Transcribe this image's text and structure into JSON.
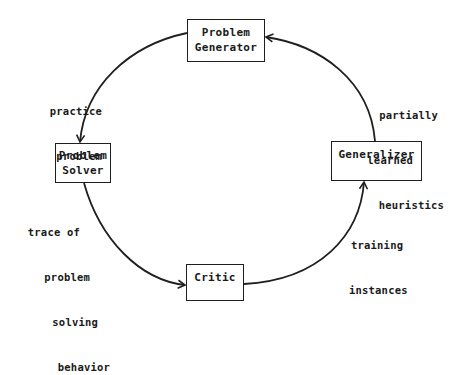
{
  "diagram": {
    "type": "learning-cycle",
    "colors": {
      "line": "#1f1f1f",
      "text": "#1a1a1a",
      "background": "#ffffff"
    },
    "nodes": [
      {
        "id": "generator",
        "lines": [
          "Problem",
          "Generator"
        ]
      },
      {
        "id": "solver",
        "lines": [
          "Problem",
          "Solver"
        ]
      },
      {
        "id": "critic",
        "lines": [
          "Critic"
        ]
      },
      {
        "id": "generalizer",
        "lines": [
          "Generalizer"
        ]
      }
    ],
    "edges": [
      {
        "from": "generator",
        "to": "solver",
        "label": [
          "practice",
          "problem"
        ]
      },
      {
        "from": "solver",
        "to": "critic",
        "label": [
          "trace of",
          "problem",
          "solving",
          "behavior"
        ]
      },
      {
        "from": "critic",
        "to": "generalizer",
        "label": [
          "training",
          "instances"
        ]
      },
      {
        "from": "generalizer",
        "to": "generator",
        "label": [
          "partially",
          "learned",
          "heuristics"
        ]
      }
    ]
  }
}
